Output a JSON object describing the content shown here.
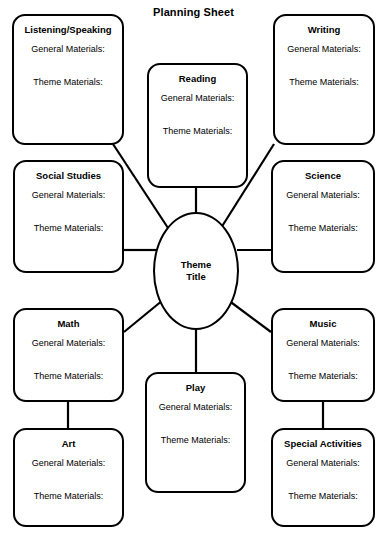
{
  "document": {
    "title": "Planning Sheet",
    "type": "planning-web-diagram",
    "field_labels": {
      "general": "General Materials:",
      "theme": "Theme Materials:"
    }
  },
  "center": {
    "label_line1": "Theme",
    "label_line2": "Title"
  },
  "nodes": [
    {
      "id": "listening-speaking",
      "title": "Listening/Speaking",
      "general": "General Materials:",
      "theme": "Theme Materials:"
    },
    {
      "id": "reading",
      "title": "Reading",
      "general": "General Materials:",
      "theme": "Theme Materials:"
    },
    {
      "id": "writing",
      "title": "Writing",
      "general": "General Materials:",
      "theme": "Theme Materials:"
    },
    {
      "id": "social-studies",
      "title": "Social Studies",
      "general": "General Materials:",
      "theme": "Theme Materials:"
    },
    {
      "id": "science",
      "title": "Science",
      "general": "General Materials:",
      "theme": "Theme Materials:"
    },
    {
      "id": "math",
      "title": "Math",
      "general": "General Materials:",
      "theme": "Theme Materials:"
    },
    {
      "id": "music",
      "title": "Music",
      "general": "General Materials:",
      "theme": "Theme Materials:"
    },
    {
      "id": "play",
      "title": "Play",
      "general": "General Materials:",
      "theme": "Theme Materials:"
    },
    {
      "id": "art",
      "title": "Art",
      "general": "General Materials:",
      "theme": "Theme Materials:"
    },
    {
      "id": "special-activities",
      "title": "Special Activities",
      "general": "General Materials:",
      "theme": "Theme Materials:"
    }
  ],
  "colors": {
    "stroke": "#000000",
    "fill": "#ffffff",
    "text": "#000000"
  }
}
